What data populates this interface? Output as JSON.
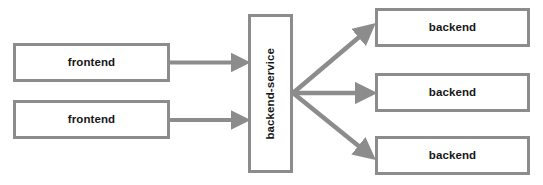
{
  "diagram": {
    "type": "architecture-flow-diagram",
    "background_color": "#ffffff",
    "stroke_color": "#8c8c8c",
    "text_color": "#161616",
    "width": 543,
    "height": 185,
    "nodes": [
      {
        "id": "frontend-1",
        "label": "frontend",
        "orientation": "horizontal",
        "column": "left"
      },
      {
        "id": "frontend-2",
        "label": "frontend",
        "orientation": "horizontal",
        "column": "left"
      },
      {
        "id": "backend-service",
        "label": "backend-service",
        "orientation": "vertical",
        "column": "middle"
      },
      {
        "id": "backend-1",
        "label": "backend",
        "orientation": "horizontal",
        "column": "right"
      },
      {
        "id": "backend-2",
        "label": "backend",
        "orientation": "horizontal",
        "column": "right"
      },
      {
        "id": "backend-3",
        "label": "backend",
        "orientation": "horizontal",
        "column": "right"
      }
    ],
    "edges": [
      {
        "id": "edge-frontend-1-to-service",
        "from": "frontend-1",
        "to": "backend-service",
        "style": "straight-arrow"
      },
      {
        "id": "edge-frontend-2-to-service",
        "from": "frontend-2",
        "to": "backend-service",
        "style": "straight-arrow"
      },
      {
        "id": "edge-service-to-backend-1",
        "from": "backend-service",
        "to": "backend-1",
        "style": "diagonal-arrow-up"
      },
      {
        "id": "edge-service-to-backend-2",
        "from": "backend-service",
        "to": "backend-2",
        "style": "straight-arrow"
      },
      {
        "id": "edge-service-to-backend-3",
        "from": "backend-service",
        "to": "backend-3",
        "style": "diagonal-arrow-down"
      }
    ]
  },
  "labels": {
    "frontend_1": "frontend",
    "frontend_2": "frontend",
    "backend_service": "backend-service",
    "backend_1": "backend",
    "backend_2": "backend",
    "backend_3": "backend"
  }
}
